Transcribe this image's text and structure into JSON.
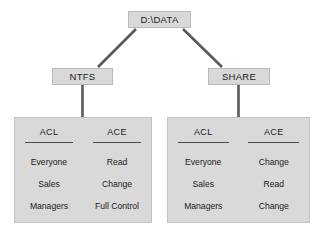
{
  "diagram": {
    "root": {
      "label": "D:\\DATA"
    },
    "branches": [
      {
        "id": "ntfs",
        "label": "NTFS",
        "table": {
          "columns": [
            {
              "header": "ACL",
              "items": [
                "Everyone",
                "Sales",
                "Managers"
              ]
            },
            {
              "header": "ACE",
              "items": [
                "Read",
                "Change",
                "Full Control"
              ]
            }
          ]
        }
      },
      {
        "id": "share",
        "label": "SHARE",
        "table": {
          "columns": [
            {
              "header": "ACL",
              "items": [
                "Everyone",
                "Sales",
                "Managers"
              ]
            },
            {
              "header": "ACE",
              "items": [
                "Change",
                "Read",
                "Change"
              ]
            }
          ]
        }
      }
    ],
    "colors": {
      "box_fill": "#d9d9d9",
      "box_border": "#b9b9b9",
      "connector": "#5a5a5a",
      "rule": "#4a4a4a",
      "text": "#1a1a1a",
      "background": "#ffffff"
    }
  }
}
